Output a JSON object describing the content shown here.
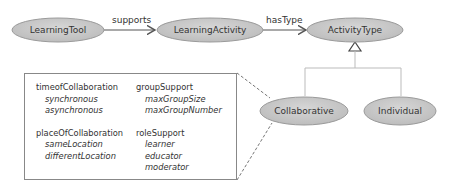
{
  "colors": {
    "node_fill": "#c8c8c8",
    "node_stroke": "#9a9a9a",
    "edge": "#555555",
    "box_border": "#888888"
  },
  "nodes": {
    "learning_tool": "LearningTool",
    "learning_activity": "LearningActivity",
    "activity_type": "ActivityType",
    "collaborative": "Collaborative",
    "individual": "Individual"
  },
  "edges": {
    "supports": "supports",
    "has_type": "hasType"
  },
  "attributes": {
    "left": [
      {
        "name": "timeofCollaboration",
        "values": [
          "synchronous",
          "asynchronous"
        ]
      },
      {
        "name": "placeOfCollaboration",
        "values": [
          "sameLocation",
          "differentLocation"
        ]
      }
    ],
    "right": [
      {
        "name": "groupSupport",
        "values": [
          "maxGroupSize",
          "maxGroupNumber"
        ]
      },
      {
        "name": "roleSupport",
        "values": [
          "learner",
          "educator",
          "moderator"
        ]
      }
    ]
  }
}
